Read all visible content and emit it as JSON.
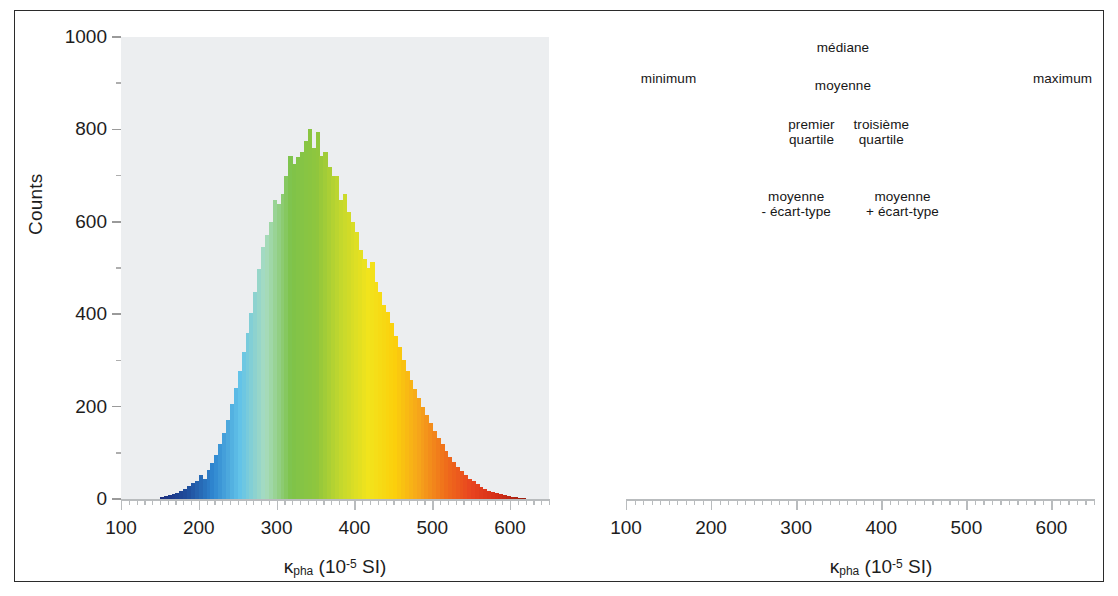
{
  "figure": {
    "panels": [
      {
        "id": "left",
        "name": "histogram-colored-gradient",
        "axis": {
          "ylabel": "Counts",
          "yticks": [
            "0",
            "200",
            "400",
            "600",
            "800",
            "1000"
          ],
          "xticks": [
            "100",
            "200",
            "300",
            "400",
            "500",
            "600"
          ],
          "xlabel_main": "κ",
          "xlabel_sub": "pha",
          "xlabel_unit_open": " (10",
          "xlabel_exp": "-5",
          "xlabel_unit_close": " SI)"
        }
      },
      {
        "id": "right",
        "name": "histogram-statistics-annotated",
        "axis": {
          "xticks": [
            "100",
            "200",
            "300",
            "400",
            "500",
            "600"
          ],
          "xlabel_main": "κ",
          "xlabel_sub": "pha",
          "xlabel_unit_open": " (10",
          "xlabel_exp": "-5",
          "xlabel_unit_close": " SI)"
        },
        "annotations": [
          {
            "key": "minimum",
            "label": "minimum",
            "value": 150,
            "style": "thin",
            "label_top": 57,
            "boxed": false
          },
          {
            "key": "mean_minus_sd",
            "label": "moyenne\n- écart-type",
            "value": 300,
            "style": "thin",
            "label_top": 175,
            "boxed": true
          },
          {
            "key": "q1",
            "label": "premier\nquartile",
            "value": 318,
            "style": "thin",
            "label_top": 103,
            "boxed": true
          },
          {
            "key": "mean",
            "label": "moyenne",
            "value": 355,
            "style": "thick",
            "label_top": 64,
            "boxed": true
          },
          {
            "key": "median",
            "label": "médiane",
            "value": 355,
            "style": "thin",
            "label_top": 26,
            "boxed": false
          },
          {
            "key": "q3",
            "label": "troisième\nquartile",
            "value": 400,
            "style": "thin",
            "label_top": 103,
            "boxed": true
          },
          {
            "key": "mean_plus_sd",
            "label": "moyenne\n+ écart-type",
            "value": 425,
            "style": "thin",
            "label_top": 175,
            "boxed": true
          },
          {
            "key": "maximum",
            "label": "maximum",
            "value": 613,
            "style": "thin",
            "label_top": 57,
            "boxed": false
          }
        ]
      }
    ]
  },
  "colors": {
    "plot_background": "#eceef0",
    "frame": "#2b2b2b",
    "axis": "#b9bcbe",
    "text": "#1d1d1d",
    "dash": "#13180f",
    "band_low": "#1f4e9c",
    "band_mid": "#6cb33f",
    "band_high": "#e8431f",
    "silhouette": "#ffffff",
    "gradient_stops": [
      "#1b2f80",
      "#1f4e9c",
      "#2f86d0",
      "#62c3e8",
      "#a8dcc0",
      "#7ec34a",
      "#8fc63d",
      "#c8d92c",
      "#f2e41c",
      "#fbd00c",
      "#f6a21b",
      "#ef6c1b",
      "#e8431f",
      "#d42d17",
      "#9c1f10"
    ]
  },
  "chart_data": {
    "type": "bar",
    "title": "",
    "xlabel": "κ_pha (10^-5 SI)",
    "ylabel": "Counts",
    "xlim": [
      100,
      650
    ],
    "ylim": [
      0,
      1000
    ],
    "bin_width": 5,
    "grid": false,
    "legend": "none",
    "x": [
      150,
      155,
      160,
      165,
      170,
      175,
      180,
      185,
      190,
      195,
      200,
      205,
      210,
      215,
      220,
      225,
      230,
      235,
      240,
      245,
      250,
      255,
      260,
      265,
      270,
      275,
      280,
      285,
      290,
      295,
      300,
      305,
      310,
      315,
      320,
      325,
      330,
      335,
      340,
      345,
      350,
      355,
      360,
      365,
      370,
      375,
      380,
      385,
      390,
      395,
      400,
      405,
      410,
      415,
      420,
      425,
      430,
      435,
      440,
      445,
      450,
      455,
      460,
      465,
      470,
      475,
      480,
      485,
      490,
      495,
      500,
      505,
      510,
      515,
      520,
      525,
      530,
      535,
      540,
      545,
      550,
      555,
      560,
      565,
      570,
      575,
      580,
      585,
      590,
      595,
      600,
      605,
      610,
      615
    ],
    "values": [
      4,
      6,
      8,
      10,
      14,
      18,
      22,
      28,
      34,
      40,
      52,
      44,
      62,
      78,
      96,
      118,
      142,
      170,
      205,
      240,
      278,
      318,
      360,
      402,
      448,
      497,
      545,
      572,
      600,
      648,
      638,
      660,
      700,
      742,
      726,
      740,
      752,
      775,
      800,
      760,
      795,
      742,
      752,
      718,
      700,
      700,
      648,
      660,
      622,
      600,
      578,
      540,
      520,
      500,
      512,
      470,
      448,
      420,
      405,
      380,
      352,
      330,
      300,
      278,
      258,
      238,
      218,
      200,
      182,
      165,
      148,
      132,
      118,
      105,
      92,
      80,
      70,
      60,
      52,
      44,
      38,
      32,
      27,
      22,
      18,
      15,
      12,
      10,
      8,
      6,
      5,
      4,
      3,
      2
    ],
    "statistics": {
      "minimum": 150,
      "mean_minus_sd": 300,
      "first_quartile": 318,
      "mean": 355,
      "median": 355,
      "third_quartile": 400,
      "mean_plus_sd": 425,
      "maximum": 613
    },
    "right_panel_bands": [
      {
        "name": "moyenne - écart-type → premier quartile",
        "from": 300,
        "to": 318,
        "color": "#1f4e9c"
      },
      {
        "name": "premier quartile → troisième quartile",
        "from": 318,
        "to": 400,
        "color": "#6cb33f"
      },
      {
        "name": "troisième quartile → moyenne + écart-type",
        "from": 400,
        "to": 425,
        "color": "#e8431f"
      }
    ]
  }
}
